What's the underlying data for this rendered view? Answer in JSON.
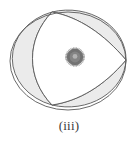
{
  "figure": {
    "caption": "(iii)",
    "title": "(iii)",
    "kind": "geometric-diagram",
    "background_color": "#ffffff"
  },
  "colors": {
    "outline": "#595959",
    "shaded_region_fill": "#ebebeb",
    "unshaded_region_fill": "#ffffff",
    "dot_outer": "#6e6e6e",
    "dot_inner": "#909090",
    "dot_highlight": "#b9b9b9",
    "caption_text": "#3a3a3a"
  },
  "geometry": {
    "outer_ellipse": {
      "name": "outer-ellipse",
      "center_x": 68,
      "center_y": 61,
      "radius_x": 58,
      "radius_y": 49
    },
    "top_cusp": {
      "x": 52,
      "y": 12
    },
    "bottom_cusp": {
      "x": 52,
      "y": 105
    },
    "right_point": {
      "x": 126,
      "y": 60
    },
    "left_extent": {
      "x": 10,
      "y": 61
    },
    "center_dot": {
      "name": "center-dot",
      "cx": 75,
      "cy": 57,
      "r": 9,
      "spokes": 40
    }
  },
  "regions": [
    {
      "id": "left-lune",
      "label": "left crescent region",
      "shaded": true
    },
    {
      "id": "central-lens",
      "label": "central lens region",
      "shaded": false
    },
    {
      "id": "top-right-sliver",
      "label": "upper right sliver",
      "shaded": true
    },
    {
      "id": "bottom-right-sliver",
      "label": "lower right sliver",
      "shaded": true
    }
  ]
}
